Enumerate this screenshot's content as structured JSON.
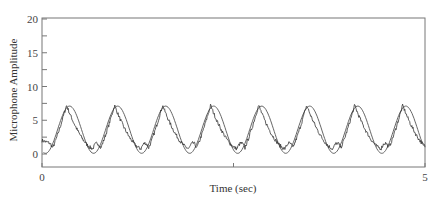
{
  "chart_data": {
    "type": "line",
    "title": "",
    "xlabel": "Time (sec)",
    "ylabel": "Microphone Amplitude",
    "xlim": [
      0,
      5
    ],
    "ylim": [
      -1.9,
      20
    ],
    "x_ticks": [
      0,
      2.5,
      5
    ],
    "x_tick_labels": [
      "0",
      "",
      "5"
    ],
    "y_ticks": [
      0,
      2.5,
      5,
      7.5,
      10,
      12.5,
      15,
      17.5,
      20
    ],
    "y_tick_labels": [
      "0",
      "",
      "5",
      "",
      "10",
      "",
      "15",
      "",
      "20"
    ],
    "grid": false,
    "legend": null,
    "series": [
      {
        "name": "Measured microphone signal",
        "style": "noisy line",
        "period_sec": 0.627,
        "first_peak_sec": 0.3,
        "peak_value": 7.2,
        "trough_value": 0.8,
        "peaks_sec": [
          0.32,
          0.95,
          1.59,
          2.2,
          2.83,
          3.45,
          4.08,
          4.72
        ]
      },
      {
        "name": "Fitted sinusoid",
        "style": "smooth line",
        "period_sec": 0.627,
        "amplitude": 3.5,
        "offset": 3.6,
        "peak_value": 7.1,
        "trough_value": 0.1,
        "peaks_sec": [
          0.36,
          0.99,
          1.62,
          2.24,
          2.87,
          3.5,
          4.12,
          4.75
        ]
      }
    ]
  }
}
